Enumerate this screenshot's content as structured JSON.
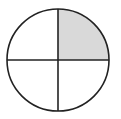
{
  "diagram": {
    "type": "fraction-circle",
    "total_parts": 4,
    "shaded_parts": 1,
    "shaded_quadrant": "upper-right",
    "fraction": "1/4",
    "colors": {
      "background": "#ffffff",
      "outline": "#222222",
      "shaded": "#d9d9d9",
      "unshaded": "#ffffff"
    },
    "geometry": {
      "cx": 58,
      "cy": 60,
      "r": 51,
      "stroke_width": 1.6
    }
  }
}
